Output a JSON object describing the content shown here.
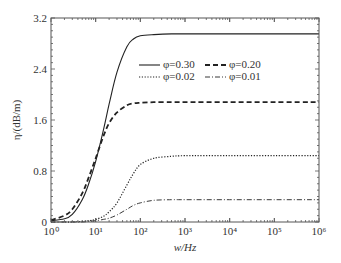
{
  "chart_data": {
    "type": "line",
    "title": "",
    "xlabel": "w/Hz",
    "ylabel": "η/(dB/m)",
    "xscale": "log",
    "xlim": [
      1,
      1000000
    ],
    "ylim": [
      0,
      3.2
    ],
    "x_ticks": [
      "10⁰",
      "10¹",
      "10²",
      "10³",
      "10⁴",
      "10⁵",
      "10⁶"
    ],
    "y_ticks": [
      "0",
      "0.8",
      "1.6",
      "2.4",
      "3.2"
    ],
    "grid": false,
    "legend_position": "upper center",
    "x": [
      1,
      2,
      3,
      5,
      7,
      10,
      15,
      20,
      30,
      50,
      70,
      100,
      200,
      500,
      1000,
      10000,
      100000,
      1000000
    ],
    "series": [
      {
        "name": "φ=0.30",
        "style": "solid",
        "values": [
          0.02,
          0.05,
          0.12,
          0.35,
          0.6,
          0.95,
          1.45,
          1.85,
          2.35,
          2.75,
          2.87,
          2.92,
          2.94,
          2.95,
          2.95,
          2.95,
          2.95,
          2.95
        ]
      },
      {
        "name": "φ=0.20",
        "style": "dashed",
        "values": [
          0.03,
          0.1,
          0.2,
          0.45,
          0.7,
          1.0,
          1.35,
          1.55,
          1.72,
          1.83,
          1.86,
          1.87,
          1.88,
          1.88,
          1.88,
          1.88,
          1.88,
          1.88
        ]
      },
      {
        "name": "φ=0.02",
        "style": "dotted",
        "values": [
          0.0,
          0.0,
          0.0,
          0.01,
          0.02,
          0.04,
          0.09,
          0.16,
          0.3,
          0.58,
          0.76,
          0.9,
          1.0,
          1.03,
          1.04,
          1.04,
          1.04,
          1.04
        ]
      },
      {
        "name": "φ=0.01",
        "style": "dashdot",
        "values": [
          0.0,
          0.0,
          0.0,
          0.0,
          0.01,
          0.02,
          0.04,
          0.06,
          0.11,
          0.2,
          0.26,
          0.3,
          0.34,
          0.35,
          0.35,
          0.35,
          0.35,
          0.35
        ]
      }
    ]
  }
}
